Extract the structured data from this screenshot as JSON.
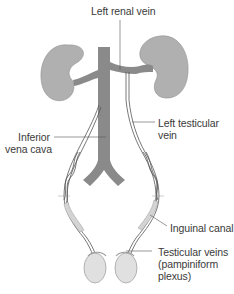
{
  "diagram": {
    "colors": {
      "kidney": "#b0b0b0",
      "kidney_outline": "#8e8e8e",
      "vena_cava": "#8a8a8a",
      "vein_outline": "#555555",
      "testis": "#e0e0e0",
      "testis_outline": "#9a9a9a",
      "canal": "#d4d4d4",
      "leader": "#555555",
      "label_text": "#3a3a3a"
    },
    "labels": {
      "left_renal_vein": "Left renal vein",
      "inferior_vena_cava_line1": "Inferior",
      "inferior_vena_cava_line2": "vena cava",
      "left_testicular_vein_line1": "Left testicular",
      "left_testicular_vein_line2": "vein",
      "inguinal_canal": "Inguinal canal",
      "testicular_veins_line1": "Testicular veins",
      "testicular_veins_line2": "(pampiniform",
      "testicular_veins_line3": "plexus)"
    }
  }
}
